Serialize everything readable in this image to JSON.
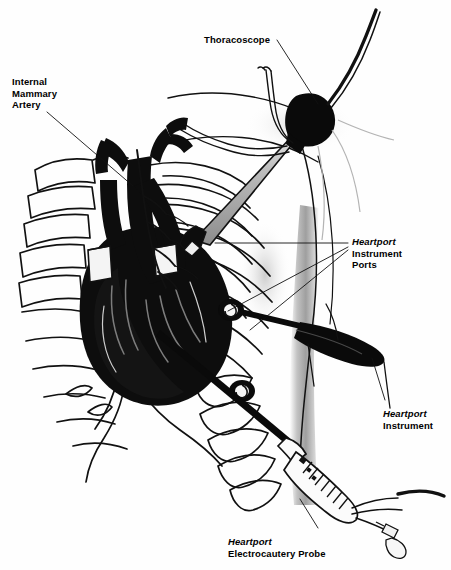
{
  "figure": {
    "background_color": "#fefefe",
    "ink_color": "#000000",
    "shade_color": "#9a9a9a",
    "width": 451,
    "height": 570
  },
  "labels": {
    "thoracoscope": {
      "text": "Thoracoscope",
      "x": 204,
      "y": 34
    },
    "internal_mammary_artery": {
      "line1": "Internal",
      "line2": "Mammary",
      "line3": "Artery",
      "x": 12,
      "y": 76
    },
    "instrument_ports": {
      "brand": "Heartport",
      "line2": "Instrument",
      "line3": "Ports",
      "x": 352,
      "y": 236
    },
    "instrument": {
      "brand": "Heartport",
      "line2": "Instrument",
      "x": 383,
      "y": 408
    },
    "electrocautery_probe": {
      "brand": "Heartport",
      "line2": "Electrocautery Probe",
      "x": 228,
      "y": 536
    }
  },
  "anatomy": {
    "parts": [
      "heart",
      "aorta",
      "pulmonary-artery",
      "superior-vena-cava",
      "internal-mammary-artery",
      "sternum",
      "ribs",
      "costal-cartilage",
      "chest-wall-shading"
    ]
  },
  "instruments": {
    "thoracoscope": {
      "name": "thoracoscope",
      "components": [
        "camera-head",
        "fiber-optic-cable",
        "light-guide-tubes",
        "scope-shaft"
      ]
    },
    "ports": [
      {
        "name": "upper-instrument-port",
        "x": 231,
        "y": 310
      },
      {
        "name": "lower-instrument-port",
        "x": 242,
        "y": 391
      }
    ],
    "instrument": {
      "name": "heartport-instrument",
      "components": [
        "shaft",
        "jaw-body",
        "handle"
      ]
    },
    "electrocautery_probe": {
      "name": "heartport-electrocautery-probe",
      "components": [
        "tip",
        "ribbed-handle",
        "control-buttons",
        "cables"
      ]
    }
  }
}
